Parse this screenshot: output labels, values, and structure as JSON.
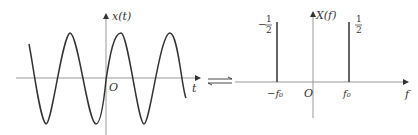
{
  "left_panel": {
    "title": "Time-domain cosine signal",
    "y_axis_label": "x(t)",
    "x_axis_label": "t",
    "origin_label": "O",
    "curve": "cosine"
  },
  "transform_symbol": "⇌",
  "right_panel": {
    "title": "Frequency spectrum",
    "y_axis_label": "X(f)",
    "x_axis_label": "f",
    "origin_label": "O",
    "ticks": [
      {
        "label": "−f₀",
        "position": "negative"
      },
      {
        "label": "f₀",
        "position": "positive"
      }
    ],
    "impulses": [
      {
        "at": "−f₀",
        "sign": "−",
        "numerator": "1",
        "denominator": "2"
      },
      {
        "at": "f₀",
        "sign": "",
        "numerator": "1",
        "denominator": "2"
      }
    ]
  },
  "colors": {
    "curve": "#333333",
    "axis": "#888888",
    "background": "#ffffff"
  }
}
